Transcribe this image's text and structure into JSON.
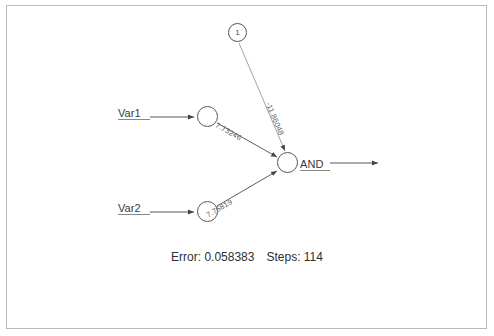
{
  "diagram": {
    "type": "neural-network",
    "bias_node_label": "1",
    "inputs": [
      {
        "name": "Var1",
        "label": "Var1"
      },
      {
        "name": "Var2",
        "label": "Var2"
      }
    ],
    "output": {
      "name": "AND",
      "label": "AND"
    },
    "weights": [
      {
        "from": "Var1",
        "to": "AND",
        "label": "7.73246"
      },
      {
        "from": "Var2",
        "to": "AND",
        "label": "7.75819"
      },
      {
        "from": "bias",
        "to": "AND",
        "label": "-11.86048"
      }
    ]
  },
  "footer": {
    "error_label": "Error: 0.058383",
    "steps_label": "Steps: 114"
  },
  "colors": {
    "stroke": "#555555",
    "text": "#3a3a3a",
    "frame": "#b9b9b9",
    "background": "#ffffff"
  }
}
